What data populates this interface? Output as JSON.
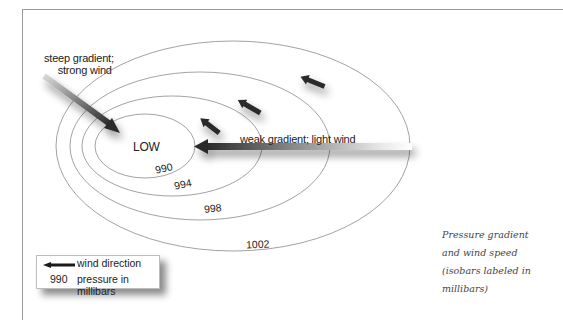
{
  "diagram": {
    "title": "Pressure gradient and wind speed",
    "center_label": "LOW",
    "annotations": {
      "steep_line1": "steep gradient;",
      "steep_line2": "strong wind",
      "weak": "weak gradient; light wind"
    },
    "isobars": [
      {
        "label": "990",
        "unit": "mb"
      },
      {
        "label": "994",
        "unit": "mb"
      },
      {
        "label": "998",
        "unit": "mb"
      },
      {
        "label": "1002",
        "unit": "mb"
      }
    ],
    "arrows": [
      {
        "name": "strong-wind-arrow",
        "description": "long gradient arrow pointing to LOW from upper-left"
      },
      {
        "name": "light-wind-arrow",
        "description": "long gradient arrow pointing to LOW from right"
      },
      {
        "name": "small-wind-arrow-1",
        "description": "short arrow, upper-left direction"
      },
      {
        "name": "small-wind-arrow-2",
        "description": "short arrow, upper-left direction"
      },
      {
        "name": "small-wind-arrow-3",
        "description": "short arrow, upper-left direction"
      }
    ]
  },
  "legend": {
    "arrow_icon": "left-arrow-icon",
    "wind_label": "wind direction",
    "pressure_sample": "990",
    "pressure_label": "pressure in millibars"
  },
  "caption": {
    "line1": "Pressure gradient",
    "line2": "and wind speed",
    "line3": "(isobars labeled in",
    "line4": "millibars)"
  },
  "colors": {
    "isobar_stroke": "#8a8a8a",
    "arrow_dark": "#2a2a2a",
    "frame": "#9a9a9a",
    "caption_text": "#444444"
  }
}
